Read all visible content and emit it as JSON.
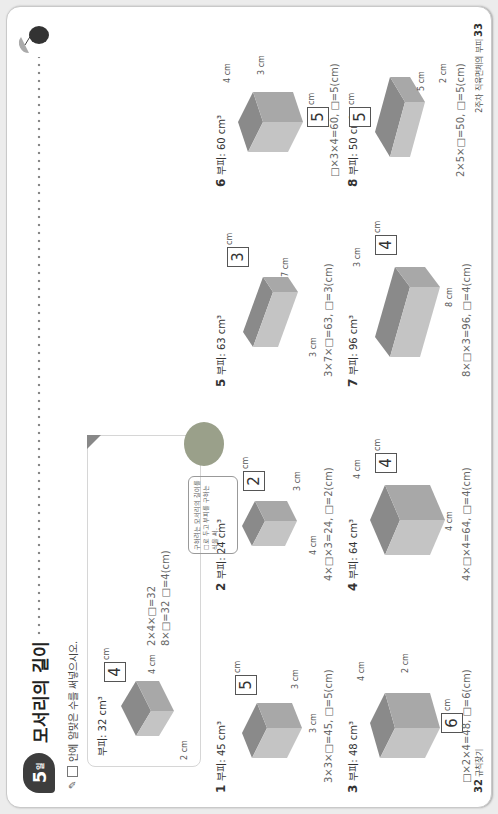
{
  "header": {
    "lesson_number": "5",
    "lesson_suffix": "일",
    "title": "모서리의 길이",
    "instruction": "안에 알맞은 수를 써넣으시오."
  },
  "example": {
    "volume_label": "부피: 32 cm³",
    "answer": "4",
    "dims": [
      "cm",
      "4 cm",
      "2 cm"
    ],
    "work_line1": "2×4×□=32",
    "work_line2": "8×□=32 □=4(cm)",
    "tip": "구하려는 모서리의 길이를 □로 두고 부피를 구하는 식을 써."
  },
  "problems": [
    {
      "num": "1",
      "volume": "부피: 45 cm³",
      "answer": "5",
      "dims": [
        "cm",
        "3 cm",
        "3 cm"
      ],
      "equation": "3×3×□=45, □=5(cm)"
    },
    {
      "num": "2",
      "volume": "부피: 24 cm³",
      "answer": "2",
      "dims": [
        "cm",
        "3 cm",
        "4 cm"
      ],
      "equation": "4×□×3=24, □=2(cm)"
    },
    {
      "num": "3",
      "volume": "부피: 48 cm³",
      "answer": "6",
      "dims": [
        "cm",
        "4 cm",
        "2 cm"
      ],
      "equation": "□×2×4=48, □=6(cm)"
    },
    {
      "num": "4",
      "volume": "부피: 64 cm³",
      "answer": "4",
      "dims": [
        "cm",
        "4 cm",
        "4 cm"
      ],
      "equation": "4×□×4=64, □=4(cm)"
    },
    {
      "num": "5",
      "volume": "부피: 63 cm³",
      "answer": "3",
      "dims": [
        "cm",
        "7 cm",
        "3 cm"
      ],
      "equation": "3×7×□=63, □=3(cm)"
    },
    {
      "num": "6",
      "volume": "부피: 60 cm³",
      "answer": "5",
      "dims": [
        "cm",
        "4 cm",
        "3 cm"
      ],
      "equation": "□×3×4=60, □=5(cm)"
    },
    {
      "num": "7",
      "volume": "부피: 96 cm³",
      "answer": "4",
      "dims": [
        "cm",
        "3 cm",
        "8 cm"
      ],
      "equation": "8×□×3=96, □=4(cm)"
    },
    {
      "num": "8",
      "volume": "부피: 50 cm³",
      "answer": "5",
      "dims": [
        "cm",
        "5 cm",
        "2 cm"
      ],
      "equation": "2×5×□=50, □=5(cm)"
    },
    {
      "num": "9",
      "volume": "부피: 98 cm³",
      "answer": "7",
      "dims": [
        "cm",
        "2 cm",
        "7 cm"
      ],
      "equation": "□×7×2=98, □=7(cm)"
    },
    {
      "num": "10",
      "volume": "부피: 512 cm³",
      "answer": "8",
      "dims": [
        "cm",
        "8 cm",
        "8 cm"
      ],
      "equation": "8×□×8=512, □=8(cm)"
    }
  ],
  "footer": {
    "left_page": "32",
    "left_label": "규칙찾기",
    "right_page": "33",
    "right_label": "2주차 직육면체의 부피"
  }
}
